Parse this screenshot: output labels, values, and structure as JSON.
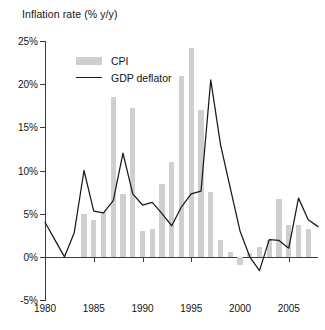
{
  "chart_data": {
    "type": "bar",
    "title": "Inflation rate (% y/y)",
    "xlabel": "",
    "ylabel": "",
    "xlim": [
      1980,
      2008
    ],
    "ylim": [
      -5,
      25
    ],
    "grid": false,
    "legend_position": "top-left",
    "y_ticks": [
      25,
      20,
      15,
      10,
      5,
      0,
      -5
    ],
    "y_tick_labels": [
      "25%",
      "20%",
      "15%",
      "10%",
      "5%",
      "0%",
      "-5%"
    ],
    "x_ticks": [
      1980,
      1985,
      1990,
      1995,
      2000,
      2005
    ],
    "x_tick_labels": [
      "1980",
      "1985",
      "1990",
      "1995",
      "2000",
      "2005"
    ],
    "series": [
      {
        "name": "CPI",
        "kind": "bar",
        "color": "#cfcfcf",
        "x": [
          1984,
          1985,
          1986,
          1987,
          1988,
          1989,
          1990,
          1991,
          1992,
          1993,
          1994,
          1995,
          1996,
          1997,
          1998,
          1999,
          2000,
          2001,
          2002,
          2003,
          2004,
          2005,
          2006,
          2007
        ],
        "values": [
          5.0,
          4.3,
          5.2,
          18.5,
          7.3,
          17.3,
          3.0,
          3.2,
          8.5,
          11.0,
          21.0,
          24.2,
          17.0,
          7.5,
          2.0,
          0.6,
          -1.0,
          0.4,
          1.1,
          2.0,
          6.7,
          3.7,
          3.7,
          3.2
        ]
      },
      {
        "name": "GDP deflator",
        "kind": "line",
        "color": "#1a1a1a",
        "x": [
          1980,
          1981,
          1982,
          1983,
          1984,
          1985,
          1986,
          1987,
          1988,
          1989,
          1990,
          1991,
          1992,
          1993,
          1994,
          1995,
          1996,
          1997,
          1998,
          1999,
          2000,
          2001,
          2002,
          2003,
          2004,
          2005,
          2006,
          2007,
          2008
        ],
        "values": [
          4.0,
          2.0,
          0.0,
          2.8,
          10.0,
          5.3,
          5.1,
          6.5,
          12.0,
          7.3,
          6.0,
          6.3,
          5.0,
          3.6,
          5.8,
          7.3,
          7.6,
          20.5,
          13.0,
          8.0,
          3.0,
          0.0,
          -1.6,
          2.0,
          1.9,
          1.0,
          6.8,
          4.3,
          3.5
        ]
      }
    ]
  },
  "legend": {
    "items": [
      {
        "label": "CPI",
        "swatch": "bar-swatch",
        "color": "#cfcfcf"
      },
      {
        "label": "GDP deflator",
        "swatch": "line-swatch",
        "color": "#1a1a1a"
      }
    ]
  }
}
